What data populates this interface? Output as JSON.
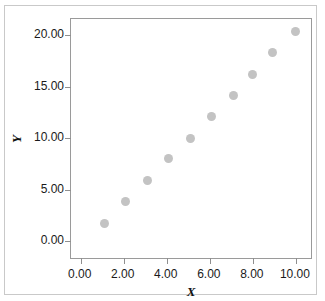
{
  "figure": {
    "top_crop_remnant": "",
    "background_color": "#ffffff",
    "border_color": "#c9c9c9"
  },
  "axes": {
    "x_title": "X",
    "y_title": "Y",
    "x_tick_labels": [
      "0.00",
      "2.00",
      "4.00",
      "6.00",
      "8.00",
      "10.00"
    ],
    "y_tick_labels": [
      "0.00",
      "5.00",
      "10.00",
      "15.00",
      "20.00"
    ],
    "frame_color": "#9a9a9a",
    "tick_color": "#8f8f8f"
  },
  "chart_data": {
    "type": "scatter",
    "title": "",
    "xlabel": "X",
    "ylabel": "Y",
    "xlim": [
      -0.45,
      10.7
    ],
    "ylim": [
      -1.65,
      21.6
    ],
    "xticks": [
      0,
      2,
      4,
      6,
      8,
      10
    ],
    "yticks": [
      0,
      5,
      10,
      15,
      20
    ],
    "xtick_labels": [
      "0.00",
      "2.00",
      "4.00",
      "6.00",
      "8.00",
      "10.00"
    ],
    "ytick_labels": [
      "0.00",
      "5.00",
      "10.00",
      "15.00",
      "20.00"
    ],
    "grid": false,
    "legend": false,
    "marker_color": "#c3c3c3",
    "marker_size": 9,
    "series": [
      {
        "name": "data",
        "x": [
          1.1,
          2.1,
          3.1,
          4.1,
          5.1,
          6.1,
          7.1,
          8.0,
          8.9,
          10.0
        ],
        "y": [
          1.7,
          3.8,
          5.9,
          8.0,
          10.0,
          12.1,
          14.2,
          16.2,
          18.3,
          20.4
        ]
      }
    ]
  }
}
